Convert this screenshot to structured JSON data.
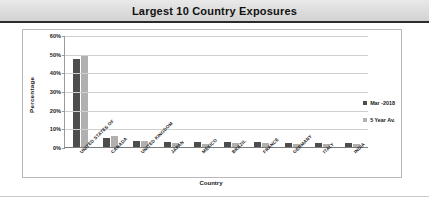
{
  "header": {
    "title": "Largest 10 Country Exposures"
  },
  "legend": {
    "items": [
      {
        "label": "Mar -2018",
        "color": "#4d4d4d",
        "swatch": "legend-swatch-dark"
      },
      {
        "label": "5 Year Av.",
        "color": "#b0b0b0",
        "swatch": "legend-swatch-light"
      }
    ]
  },
  "chart_data": {
    "type": "bar",
    "title": "Largest 10 Country Exposures",
    "xlabel": "Country",
    "ylabel": "Percentage",
    "ylim": [
      0,
      60
    ],
    "ytick_labels": [
      "60%",
      "50%",
      "40%",
      "30%",
      "20%",
      "10%",
      "0%"
    ],
    "ytick_values": [
      60,
      50,
      40,
      30,
      20,
      10,
      0
    ],
    "grid": true,
    "legend_position": "right",
    "categories": [
      "UNITED STATES OF",
      "CANADA",
      "UNITED KINGDOM",
      "JAPAN",
      "MEXICO",
      "BRAZIL",
      "FRANCE",
      "GERMANY",
      "ITALY",
      "INDIA"
    ],
    "series": [
      {
        "name": "Mar -2018",
        "color": "#4d4d4d",
        "values": [
          47,
          5,
          3,
          2.5,
          2.5,
          2.5,
          2.5,
          2,
          2,
          2
        ]
      },
      {
        "name": "5 Year Av.",
        "color": "#b0b0b0",
        "values": [
          49,
          6,
          3,
          2,
          1.5,
          2,
          2,
          1.5,
          1.5,
          1.5
        ]
      }
    ]
  }
}
